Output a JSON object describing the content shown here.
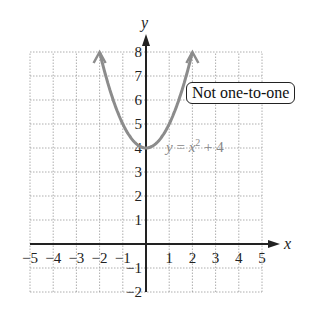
{
  "chart_data": {
    "type": "line",
    "title": "",
    "xlabel": "x",
    "ylabel": "y",
    "xlim": [
      -5,
      5
    ],
    "ylim": [
      -2,
      8
    ],
    "grid": true,
    "x_ticks": [
      "−5",
      "−4",
      "−3",
      "−2",
      "−1",
      "1",
      "2",
      "3",
      "4",
      "5"
    ],
    "y_ticks": [
      "−2",
      "−1",
      "1",
      "2",
      "3",
      "4",
      "5",
      "6",
      "7",
      "8"
    ],
    "series": [
      {
        "name": "y = x² + 4",
        "function": "x^2 + 4",
        "x": [
          -2,
          -1.5,
          -1,
          -0.5,
          0,
          0.5,
          1,
          1.5,
          2
        ],
        "values": [
          8,
          6.25,
          5,
          4.25,
          4,
          4.25,
          5,
          6.25,
          8
        ],
        "color": "#8c8c8c"
      }
    ],
    "annotations": [
      "Not one-to-one",
      "y = x² + 4"
    ]
  },
  "labels": {
    "x_axis": "x",
    "y_axis": "y",
    "equation": "y = x² + 4",
    "callout": "Not one-to-one"
  }
}
